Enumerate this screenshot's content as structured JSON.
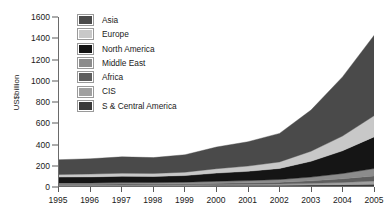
{
  "chart_data": {
    "type": "area",
    "title": "",
    "subtitle": "",
    "xlabel": "",
    "ylabel": "US$billion",
    "x": [
      1995,
      1996,
      1997,
      1998,
      1999,
      2000,
      2001,
      2002,
      2003,
      2004,
      2005
    ],
    "xtick_labels": [
      "1995",
      "1996",
      "1997",
      "1998",
      "1999",
      "2000",
      "2001",
      "2002",
      "2003",
      "2004",
      "2005"
    ],
    "ylim": [
      0,
      1600
    ],
    "ytick_labels": [
      "0",
      "200",
      "400",
      "600",
      "800",
      "1000",
      "1200",
      "1400",
      "1600"
    ],
    "yticks": [
      0,
      200,
      400,
      600,
      800,
      1000,
      1200,
      1400,
      1600
    ],
    "grid": false,
    "stacked": true,
    "legend_position": "top-left-inside",
    "series": [
      {
        "name": "Asia",
        "color": "#4a4a4a",
        "values": [
          140,
          145,
          155,
          150,
          165,
          205,
          230,
          270,
          390,
          560,
          760
        ]
      },
      {
        "name": "Europe",
        "color": "#c8c8c8",
        "values": [
          25,
          27,
          29,
          28,
          32,
          42,
          50,
          62,
          95,
          140,
          200
        ]
      },
      {
        "name": "North America",
        "color": "#151515",
        "values": [
          55,
          57,
          60,
          58,
          63,
          78,
          88,
          105,
          150,
          215,
          300
        ]
      },
      {
        "name": "Middle East",
        "color": "#8c8c8c",
        "values": [
          12,
          12,
          13,
          13,
          14,
          18,
          21,
          25,
          35,
          50,
          70
        ]
      },
      {
        "name": "Africa",
        "color": "#5e5e5e",
        "values": [
          8,
          8,
          9,
          9,
          10,
          12,
          14,
          17,
          24,
          34,
          48
        ]
      },
      {
        "name": "CIS",
        "color": "#a0a0a0",
        "values": [
          5,
          5,
          6,
          6,
          7,
          8,
          9,
          11,
          15,
          21,
          30
        ]
      },
      {
        "name": "S & Central America",
        "color": "#3a3a3a",
        "values": [
          4,
          4,
          4,
          5,
          5,
          6,
          7,
          8,
          10,
          13,
          17
        ]
      }
    ],
    "totals": [
      249,
      258,
      276,
      269,
      296,
      369,
      419,
      498,
      719,
      1033,
      1425
    ]
  },
  "axis": {
    "y_title": "US$billion"
  },
  "legend": {
    "items": [
      {
        "label": "Asia"
      },
      {
        "label": "Europe"
      },
      {
        "label": "North America"
      },
      {
        "label": "Middle East"
      },
      {
        "label": "Africa"
      },
      {
        "label": "CIS"
      },
      {
        "label": "S & Central America"
      }
    ]
  }
}
